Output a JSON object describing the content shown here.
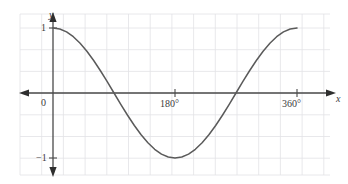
{
  "figure": {
    "name": "cosine-graph",
    "caption": ""
  },
  "labels": {
    "y_axis": "y",
    "x_axis": "x",
    "origin": "0",
    "y_top": "1",
    "y_bottom": "−1",
    "x_mid": "180°",
    "x_end": "360°"
  },
  "colors": {
    "curve": "#5a5a5a",
    "axis": "#4a4a4a",
    "grid": "#e2e2e6",
    "text": "#3b3b3b",
    "background": "#ffffff"
  },
  "chart_data": {
    "type": "line",
    "title": "",
    "xlabel": "x",
    "ylabel": "y",
    "xlim": [
      -30,
      420
    ],
    "ylim": [
      -1.45,
      1.45
    ],
    "grid": true,
    "legend": "none",
    "xticks": [
      0,
      180,
      360
    ],
    "xticklabels": [
      "0",
      "180°",
      "360°"
    ],
    "yticks": [
      -1,
      1
    ],
    "yticklabels": [
      "−1",
      "1"
    ],
    "series": [
      {
        "name": "y = cos x",
        "x": [
          0,
          10,
          20,
          30,
          40,
          50,
          60,
          70,
          80,
          90,
          100,
          110,
          120,
          130,
          140,
          150,
          160,
          170,
          180,
          190,
          200,
          210,
          220,
          230,
          240,
          250,
          260,
          270,
          280,
          290,
          300,
          310,
          320,
          330,
          340,
          350,
          360
        ],
        "y": [
          1.0,
          0.985,
          0.94,
          0.866,
          0.766,
          0.643,
          0.5,
          0.342,
          0.174,
          0.0,
          -0.174,
          -0.342,
          -0.5,
          -0.643,
          -0.766,
          -0.866,
          -0.94,
          -0.985,
          -1.0,
          -0.985,
          -0.94,
          -0.866,
          -0.766,
          -0.643,
          -0.5,
          -0.342,
          -0.174,
          0.0,
          0.174,
          0.342,
          0.5,
          0.643,
          0.766,
          0.866,
          0.94,
          0.985,
          1.0
        ]
      }
    ],
    "annotations": []
  },
  "geometry": {
    "grid_left": 20,
    "grid_right": 330,
    "grid_top": 14,
    "grid_bottom": 175,
    "grid_step_x": 21.7,
    "grid_step_y": 21.7,
    "x_axis_y": 93,
    "y_axis_x": 53,
    "x_unit_px": 0.6778,
    "y_unit_px": 65
  }
}
